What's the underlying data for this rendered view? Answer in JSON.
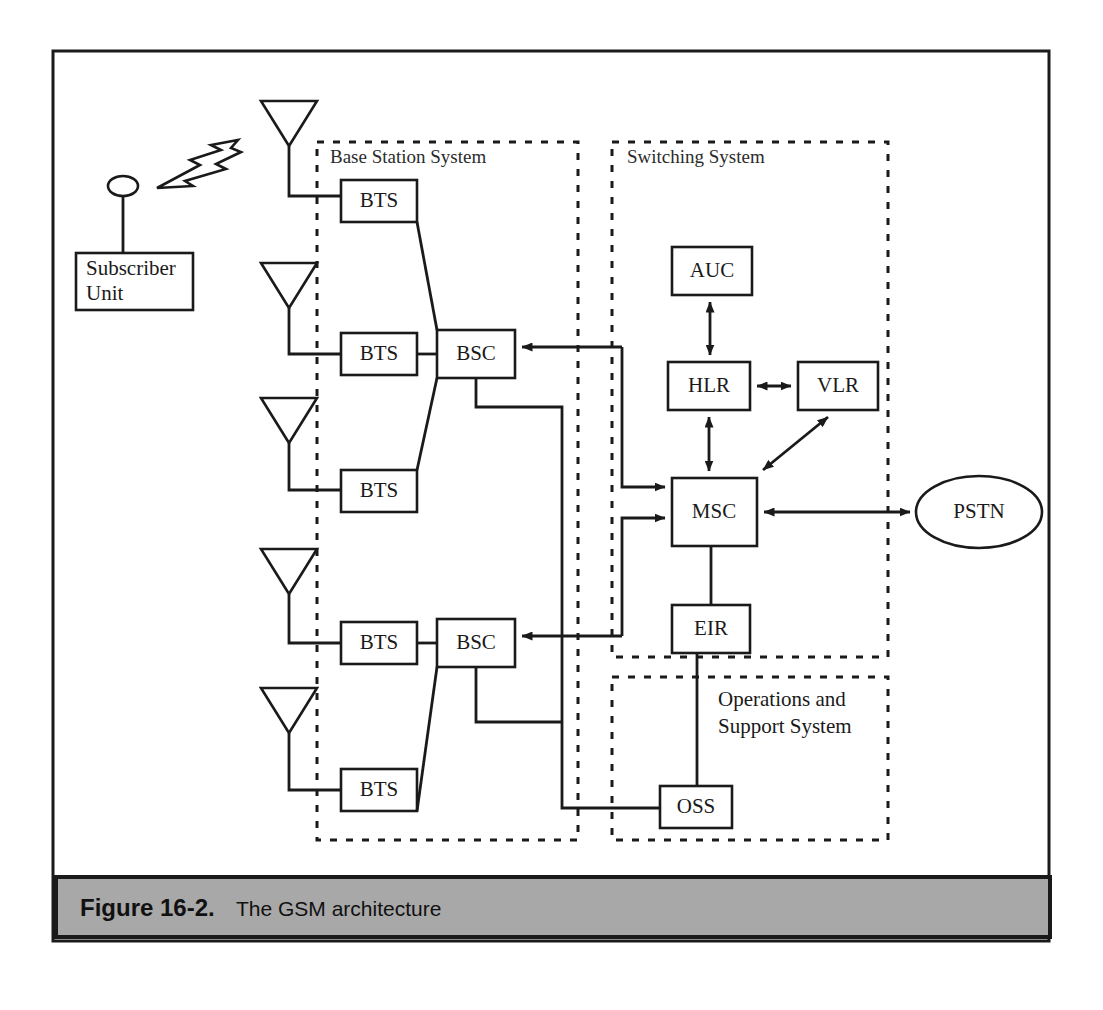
{
  "figure": {
    "caption_number": "Figure 16-2.",
    "caption_title": "The GSM architecture",
    "caption_bar_color": "#a8a8a8",
    "line_color": "#1a1a1a",
    "background_color": "#ffffff"
  },
  "groups": {
    "base_station_system": {
      "label": "Base Station System"
    },
    "switching_system": {
      "label": "Switching System"
    },
    "operations_support_system": {
      "label_line1": "Operations and",
      "label_line2": "Support  System"
    }
  },
  "nodes": {
    "subscriber_unit": {
      "line1": "Subscriber",
      "line2": "Unit"
    },
    "bts1": {
      "label": "BTS"
    },
    "bts2": {
      "label": "BTS"
    },
    "bts3": {
      "label": "BTS"
    },
    "bts4": {
      "label": "BTS"
    },
    "bts5": {
      "label": "BTS"
    },
    "bsc_upper": {
      "label": "BSC"
    },
    "bsc_lower": {
      "label": "BSC"
    },
    "auc": {
      "label": "AUC"
    },
    "hlr": {
      "label": "HLR"
    },
    "vlr": {
      "label": "VLR"
    },
    "msc": {
      "label": "MSC"
    },
    "eir": {
      "label": "EIR"
    },
    "oss": {
      "label": "OSS"
    },
    "pstn": {
      "label": "PSTN"
    }
  },
  "icons": {
    "antenna1": "antenna-icon",
    "antenna2": "antenna-icon",
    "antenna3": "antenna-icon",
    "antenna4": "antenna-icon",
    "antenna5": "antenna-icon",
    "subscriber_antenna": "subscriber-antenna-icon",
    "radio_wave": "lightning-bolt-icon"
  },
  "connections": [
    {
      "from": "subscriber_unit",
      "to": "antenna1",
      "kind": "radio",
      "arrow": "none"
    },
    {
      "from": "antenna1",
      "to": "bts1",
      "kind": "line",
      "arrow": "none"
    },
    {
      "from": "antenna2",
      "to": "bts2",
      "kind": "line",
      "arrow": "none"
    },
    {
      "from": "antenna3",
      "to": "bts3",
      "kind": "line",
      "arrow": "none"
    },
    {
      "from": "antenna4",
      "to": "bts4",
      "kind": "line",
      "arrow": "none"
    },
    {
      "from": "antenna5",
      "to": "bts5",
      "kind": "line",
      "arrow": "none"
    },
    {
      "from": "bts1",
      "to": "bsc_upper",
      "kind": "diagonal",
      "arrow": "none"
    },
    {
      "from": "bts2",
      "to": "bsc_upper",
      "kind": "line",
      "arrow": "none"
    },
    {
      "from": "bts3",
      "to": "bsc_upper",
      "kind": "diagonal",
      "arrow": "none"
    },
    {
      "from": "bts4",
      "to": "bsc_lower",
      "kind": "line",
      "arrow": "none"
    },
    {
      "from": "bts5",
      "to": "bsc_lower",
      "kind": "diagonal",
      "arrow": "none"
    },
    {
      "from": "msc",
      "to": "bsc_upper",
      "kind": "orthogonal",
      "arrow": "single"
    },
    {
      "from": "bsc_upper",
      "to": "msc",
      "kind": "orthogonal",
      "arrow": "single"
    },
    {
      "from": "msc",
      "to": "bsc_lower",
      "kind": "orthogonal",
      "arrow": "single"
    },
    {
      "from": "bsc_lower",
      "to": "oss",
      "kind": "orthogonal",
      "arrow": "none"
    },
    {
      "from": "auc",
      "to": "hlr",
      "kind": "line",
      "arrow": "double"
    },
    {
      "from": "hlr",
      "to": "vlr",
      "kind": "line",
      "arrow": "double"
    },
    {
      "from": "hlr",
      "to": "msc",
      "kind": "line",
      "arrow": "double"
    },
    {
      "from": "vlr",
      "to": "msc",
      "kind": "diagonal",
      "arrow": "double"
    },
    {
      "from": "msc",
      "to": "pstn",
      "kind": "line",
      "arrow": "double"
    },
    {
      "from": "msc",
      "to": "eir",
      "kind": "line",
      "arrow": "none"
    },
    {
      "from": "eir",
      "to": "oss",
      "kind": "line",
      "arrow": "none"
    }
  ]
}
